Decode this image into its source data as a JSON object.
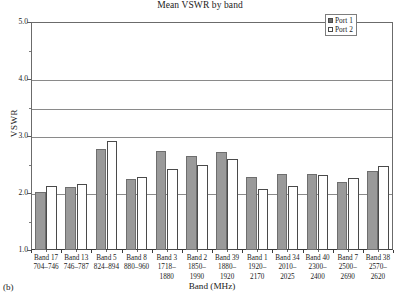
{
  "caption": "(b)",
  "legend": {
    "position": "top-right",
    "entries": [
      {
        "label": "Port 1",
        "swatch": "filled-gray"
      },
      {
        "label": "Port 2",
        "swatch": "empty-white"
      }
    ]
  },
  "colors": {
    "port1_fill": "#9a9a9a",
    "port1_edge": "#6e6e6e",
    "port2_fill": "#ffffff",
    "port2_edge": "#4a4a4a",
    "gridline": "#8a8a8a",
    "axis": "#3a3a3a"
  },
  "chart_data": {
    "type": "bar",
    "title": "Mean VSWR by band",
    "xlabel": "Band (MHz)",
    "ylabel": "VSWR",
    "ylim": [
      1.0,
      5.0
    ],
    "ytick_labels": [
      "1.0",
      "2.0",
      "3.0",
      "4.0",
      "5.0"
    ],
    "ytick_values": [
      1.0,
      2.0,
      3.0,
      4.0,
      5.0
    ],
    "yminor_values": [
      1.5,
      2.5,
      3.5,
      4.5
    ],
    "gridlines": [
      2.0,
      3.0,
      3.5,
      4.0
    ],
    "grid": true,
    "categories": [
      "Band 17",
      "Band 13",
      "Band 5",
      "Band 8",
      "Band 3",
      "Band 2",
      "Band 39",
      "Band 1",
      "Band 34",
      "Band 40",
      "Band 7",
      "Band 38"
    ],
    "category_ranges": [
      "704–746",
      "746–787",
      "824–894",
      "880–960",
      "1718–\n1880",
      "1850–\n1990",
      "1880–\n1920",
      "1920–\n2170",
      "2010–\n2025",
      "2300–\n2400",
      "2500–\n2690",
      "2570–\n2620"
    ],
    "series": [
      {
        "name": "Port 1",
        "values": [
          2.02,
          2.1,
          2.78,
          2.24,
          2.73,
          2.65,
          2.72,
          2.28,
          2.33,
          2.34,
          2.2,
          2.38
        ]
      },
      {
        "name": "Port 2",
        "values": [
          2.12,
          2.16,
          2.92,
          2.28,
          2.42,
          2.5,
          2.6,
          2.07,
          2.12,
          2.32,
          2.26,
          2.48
        ]
      }
    ]
  }
}
